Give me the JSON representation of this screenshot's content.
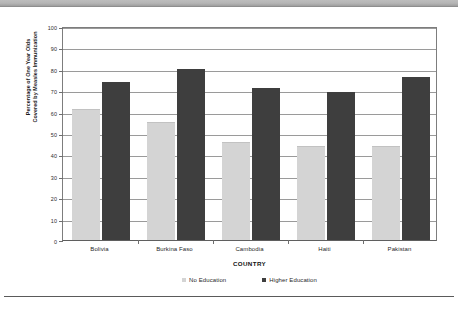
{
  "chart_data": {
    "type": "bar",
    "title": "",
    "subtitle": "",
    "xlabel": "COUNTRY",
    "ylabel_line1": "Percentage of One Year Olds",
    "ylabel_line2": "Covered by Measles Immunization",
    "categories": [
      "Bolivia",
      "Burkina Faso",
      "Cambodia",
      "Haiti",
      "Pakistan"
    ],
    "series": [
      {
        "name": "No Education",
        "color": "#d4d4d4",
        "values": [
          61,
          55,
          46,
          44,
          44
        ]
      },
      {
        "name": "Higher Education",
        "color": "#3e3e3e",
        "values": [
          74,
          80,
          71,
          69,
          76
        ]
      }
    ],
    "ylim": [
      0,
      100
    ],
    "ytick_values": [
      0,
      10,
      20,
      30,
      40,
      50,
      60,
      70,
      80,
      90,
      100
    ],
    "ytick_labels": [
      "0",
      "10",
      "20",
      "30",
      "40",
      "50",
      "60",
      "70",
      "80",
      "90",
      "100"
    ],
    "grid": true,
    "grid_axis": "y",
    "legend_position": "bottom"
  },
  "legend": {
    "items": [
      {
        "label": "No Education",
        "swatch_color": "#d4d4d4"
      },
      {
        "label": "Higher Education",
        "swatch_color": "#3e3e3e"
      }
    ]
  }
}
